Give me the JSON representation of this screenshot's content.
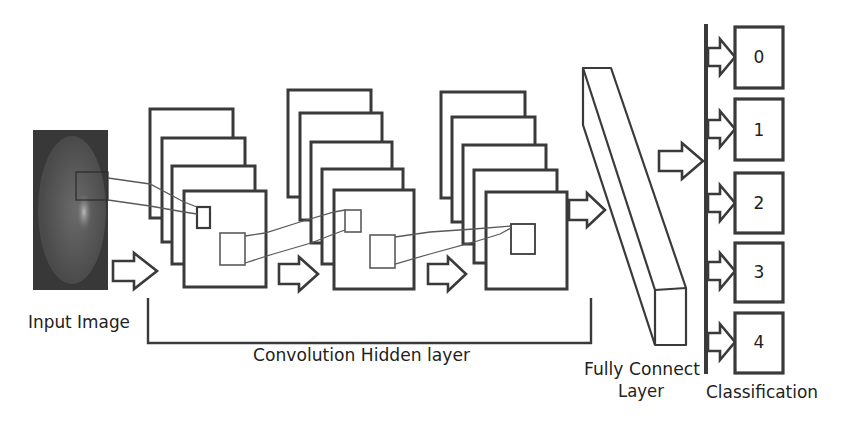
{
  "diagram": {
    "labels": {
      "input": "Input Image",
      "conv": "Convolution Hidden layer",
      "fc_line1": "Fully Connect",
      "fc_line2": "Layer",
      "classification": "Classification"
    },
    "classes": [
      {
        "label": "0"
      },
      {
        "label": "1"
      },
      {
        "label": "2"
      },
      {
        "label": "3"
      },
      {
        "label": "4"
      }
    ],
    "feature_map_stacks": [
      {
        "name": "conv-stack-1",
        "maps": 4
      },
      {
        "name": "conv-stack-2",
        "maps": 5
      },
      {
        "name": "conv-stack-3",
        "maps": 5
      }
    ],
    "colors": {
      "stroke": "#3a3a3a",
      "link": "#5a5a5a",
      "input_bg": "#3a3a3a",
      "input_ellipse": "#5c5c5c",
      "background": "#ffffff"
    }
  }
}
